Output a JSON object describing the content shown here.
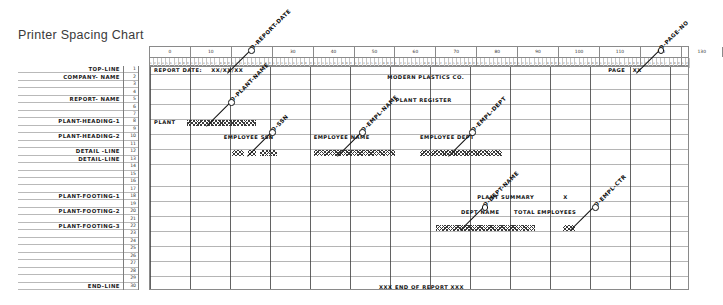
{
  "title": "Printer Spacing Chart",
  "ruler": {
    "tens_labels": [
      "0",
      "10",
      "20",
      "30",
      "40",
      "50",
      "60",
      "70",
      "80",
      "90",
      "100",
      "110",
      "120",
      "130"
    ],
    "unit_digits": [
      "1",
      "2",
      "3",
      "4",
      "5",
      "6",
      "7",
      "8",
      "9",
      "0"
    ],
    "start_column": 0,
    "end_column": 132
  },
  "row_labels": [
    {
      "row": 1,
      "label": "TOP-LINE"
    },
    {
      "row": 2,
      "label": "COMPANY- NAME"
    },
    {
      "row": 5,
      "label": "REPORT- NAME"
    },
    {
      "row": 8,
      "label": "PLANT-HEADING-1"
    },
    {
      "row": 10,
      "label": "PLANT-HEADING-2"
    },
    {
      "row": 12,
      "label": "DETAIL -LINE"
    },
    {
      "row": 13,
      "label": "DETAIL-LINE"
    },
    {
      "row": 18,
      "label": "PLANT-FOOTING-1"
    },
    {
      "row": 20,
      "label": "PLANT-FOOTING-2"
    },
    {
      "row": 22,
      "label": "PLANT-FOOTING-3"
    },
    {
      "row": 30,
      "label": "END-LINE"
    }
  ],
  "row_numbers": [
    "1",
    "2",
    "3",
    "4",
    "5",
    "6",
    "7",
    "8",
    "9",
    "10",
    "11",
    "12",
    "13",
    "14",
    "15",
    "16",
    "17",
    "18",
    "19",
    "20",
    "21",
    "22",
    "23",
    "24",
    "25",
    "26",
    "27",
    "28",
    "29",
    "30"
  ],
  "grid_texts": [
    {
      "name": "report-date-label",
      "row": 1,
      "col": 1,
      "text": "REPORT DATE:"
    },
    {
      "name": "report-date-value",
      "row": 1,
      "col": 15,
      "text": "XX/XX/XX"
    },
    {
      "name": "page-label",
      "row": 1,
      "col": 112,
      "text": "PAGE"
    },
    {
      "name": "page-value",
      "row": 1,
      "col": 118,
      "text": "XX"
    },
    {
      "name": "company-name",
      "row": 2,
      "col": 58,
      "text": "MODERN PLASTICS CO."
    },
    {
      "name": "report-name",
      "row": 5,
      "col": 60,
      "text": "PLANT REGISTER"
    },
    {
      "name": "plant-label",
      "row": 8,
      "col": 1,
      "text": "PLANT"
    },
    {
      "name": "employee-ssn-heading",
      "row": 10,
      "col": 18,
      "text": "EMPLOYEE SSN"
    },
    {
      "name": "employee-name-heading",
      "row": 10,
      "col": 40,
      "text": "EMPLOYEE NAME"
    },
    {
      "name": "employee-dept-heading",
      "row": 10,
      "col": 66,
      "text": "EMPLOYEE DEPT"
    },
    {
      "name": "plant-summary-label",
      "row": 18,
      "col": 80,
      "text": "PLANT SUMMARY"
    },
    {
      "name": "plant-summary-value",
      "row": 18,
      "col": 101,
      "text": "X"
    },
    {
      "name": "dept-name-heading",
      "row": 20,
      "col": 76,
      "text": "DEPT NAME"
    },
    {
      "name": "total-employees-heading",
      "row": 20,
      "col": 89,
      "text": "TOTAL EMPLOYEES"
    },
    {
      "name": "end-of-report-line",
      "row": 30,
      "col": 56,
      "text": "XXX  END OF REPORT  XXX"
    }
  ],
  "x_blocks": [
    {
      "name": "plant-name-field",
      "row": 8,
      "col": 9,
      "len": 17
    },
    {
      "name": "ssn-part-1",
      "row": 12,
      "col": 20,
      "len": 3
    },
    {
      "name": "ssn-part-2",
      "row": 12,
      "col": 24,
      "len": 2
    },
    {
      "name": "ssn-part-3",
      "row": 12,
      "col": 27,
      "len": 4
    },
    {
      "name": "empl-name-field",
      "row": 12,
      "col": 40,
      "len": 20
    },
    {
      "name": "empl-dept-field",
      "row": 12,
      "col": 66,
      "len": 20
    },
    {
      "name": "dept-name-field",
      "row": 22,
      "col": 70,
      "len": 24
    },
    {
      "name": "empl-counter-field",
      "row": 22,
      "col": 101,
      "len": 3
    }
  ],
  "annotations": [
    {
      "name": "o-report-date",
      "text": "O-REPORT-DATE",
      "anchor_row": 1,
      "anchor_col": 19
    },
    {
      "name": "o-page-no",
      "text": "O-PAGE-NO",
      "anchor_row": 1,
      "anchor_col": 119
    },
    {
      "name": "o-plant-name",
      "text": "O-PLANT-NAME",
      "anchor_row": 8,
      "anchor_col": 14
    },
    {
      "name": "o-ssn",
      "text": "O-SSN",
      "anchor_row": 12,
      "anchor_col": 24
    },
    {
      "name": "o-empl-name",
      "text": "O-EMPL-NAME",
      "anchor_row": 12,
      "anchor_col": 46
    },
    {
      "name": "o-empl-dept",
      "text": "O-EMPL-DEPT",
      "anchor_row": 12,
      "anchor_col": 73
    },
    {
      "name": "o-dept-name",
      "text": "O-DEPT-NAME",
      "anchor_row": 22,
      "anchor_col": 76
    },
    {
      "name": "o-empl-ctr",
      "text": "O-EMPL-CTR",
      "anchor_row": 22,
      "anchor_col": 103
    }
  ]
}
